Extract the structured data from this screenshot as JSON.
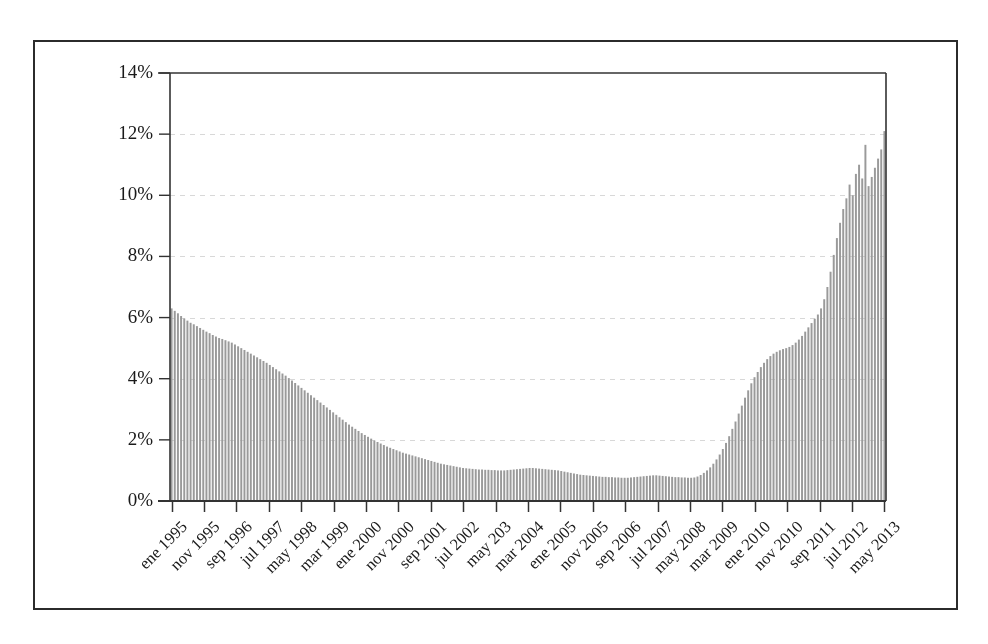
{
  "chart_data": {
    "type": "bar",
    "title": "",
    "subtitle": "",
    "xlabel": "",
    "ylabel": "",
    "ylim": [
      0,
      14
    ],
    "ytick_values": [
      0,
      2,
      4,
      6,
      8,
      10,
      12,
      14
    ],
    "ytick_labels": [
      "0%",
      "2%",
      "4%",
      "6%",
      "8%",
      "10%",
      "12%",
      "14%"
    ],
    "grid": true,
    "grid_style": "dashed-horizontal",
    "legend": null,
    "bar_color": "#9a9a9a",
    "axis_color": "#333333",
    "grid_color": "#d8d8d8",
    "xtick_labels": [
      "ene 1995",
      "nov 1995",
      "sep 1996",
      "jul 1997",
      "may 1998",
      "mar 1999",
      "ene 2000",
      "nov 2000",
      "sep 2001",
      "jul 2002",
      "may 203",
      "mar 2004",
      "ene 2005",
      "nov 2005",
      "sep 2006",
      "jul 2007",
      "may 2008",
      "mar 2009",
      "ene 2010",
      "nov 2010",
      "sep 2011",
      "jul 2012",
      "may 2013"
    ],
    "xtick_interval_months": 10,
    "x_start": "ene 1995",
    "x_end": "may 2013",
    "n_points": 221,
    "values": [
      6.3,
      6.22,
      6.14,
      6.05,
      5.97,
      5.9,
      5.83,
      5.78,
      5.72,
      5.66,
      5.6,
      5.54,
      5.49,
      5.43,
      5.38,
      5.33,
      5.3,
      5.26,
      5.22,
      5.18,
      5.12,
      5.06,
      5.0,
      4.94,
      4.88,
      4.82,
      4.76,
      4.7,
      4.64,
      4.58,
      4.52,
      4.45,
      4.38,
      4.31,
      4.24,
      4.17,
      4.1,
      4.02,
      3.94,
      3.86,
      3.78,
      3.7,
      3.62,
      3.54,
      3.46,
      3.38,
      3.3,
      3.22,
      3.14,
      3.06,
      2.98,
      2.9,
      2.82,
      2.74,
      2.66,
      2.58,
      2.5,
      2.43,
      2.36,
      2.29,
      2.22,
      2.16,
      2.1,
      2.04,
      1.98,
      1.93,
      1.88,
      1.83,
      1.78,
      1.74,
      1.7,
      1.66,
      1.62,
      1.58,
      1.55,
      1.52,
      1.49,
      1.46,
      1.43,
      1.4,
      1.37,
      1.34,
      1.31,
      1.28,
      1.25,
      1.22,
      1.2,
      1.18,
      1.16,
      1.14,
      1.12,
      1.1,
      1.08,
      1.07,
      1.06,
      1.05,
      1.04,
      1.03,
      1.03,
      1.02,
      1.02,
      1.01,
      1.01,
      1.0,
      1.0,
      1.0,
      1.01,
      1.02,
      1.03,
      1.04,
      1.05,
      1.06,
      1.07,
      1.08,
      1.08,
      1.07,
      1.06,
      1.05,
      1.04,
      1.03,
      1.02,
      1.01,
      1.0,
      0.98,
      0.96,
      0.94,
      0.92,
      0.9,
      0.88,
      0.86,
      0.85,
      0.84,
      0.83,
      0.82,
      0.81,
      0.8,
      0.79,
      0.79,
      0.78,
      0.78,
      0.77,
      0.77,
      0.76,
      0.76,
      0.76,
      0.77,
      0.78,
      0.79,
      0.8,
      0.81,
      0.82,
      0.83,
      0.84,
      0.84,
      0.83,
      0.82,
      0.81,
      0.8,
      0.79,
      0.78,
      0.78,
      0.77,
      0.77,
      0.76,
      0.76,
      0.77,
      0.8,
      0.85,
      0.92,
      1.0,
      1.1,
      1.22,
      1.36,
      1.52,
      1.7,
      1.9,
      2.12,
      2.36,
      2.6,
      2.86,
      3.12,
      3.38,
      3.62,
      3.85,
      4.05,
      4.22,
      4.38,
      4.52,
      4.64,
      4.74,
      4.82,
      4.88,
      4.93,
      4.97,
      5.0,
      5.04,
      5.1,
      5.18,
      5.28,
      5.4,
      5.54,
      5.68,
      5.82,
      5.96,
      6.1,
      6.3,
      6.6,
      7.0,
      7.5,
      8.05,
      8.6,
      9.1,
      9.55,
      9.9,
      10.35,
      10.0,
      10.7,
      11.0,
      10.55,
      11.65,
      10.3,
      10.6,
      10.9,
      11.2,
      11.5,
      12.1
    ]
  }
}
